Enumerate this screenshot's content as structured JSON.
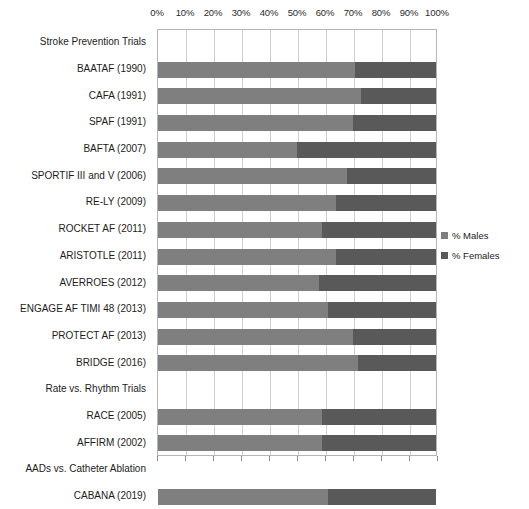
{
  "chart_data": {
    "type": "bar",
    "subtype": "stacked-horizontal-100pct",
    "title": "",
    "xlabel": "",
    "ylabel": "",
    "xlim": [
      0,
      100
    ],
    "grid": true,
    "orientation": "horizontal",
    "legend_position": "right",
    "xticks": [
      "0%",
      "10%",
      "20%",
      "30%",
      "40%",
      "50%",
      "60%",
      "70%",
      "80%",
      "90%",
      "100%"
    ],
    "xtick_values": [
      0,
      10,
      20,
      30,
      40,
      50,
      60,
      70,
      80,
      90,
      100
    ],
    "categories": [
      "Stroke Prevention Trials",
      "BAATAF (1990)",
      "CAFA (1991)",
      "SPAF (1991)",
      "BAFTA (2007)",
      "SPORTIF III and V (2006)",
      "RE-LY (2009)",
      "ROCKET AF (2011)",
      "ARISTOTLE (2011)",
      "AVERROES (2012)",
      "ENGAGE AF TIMI 48 (2013)",
      "PROTECT AF (2013)",
      "BRIDGE (2016)",
      "Rate vs. Rhythm Trials",
      "RACE (2005)",
      "AFFIRM (2002)",
      "AADs vs. Catheter Ablation",
      "CABANA (2019)"
    ],
    "category_is_header": [
      true,
      false,
      false,
      false,
      false,
      false,
      false,
      false,
      false,
      false,
      false,
      false,
      false,
      true,
      false,
      false,
      true,
      false
    ],
    "series": [
      {
        "name": "% Males",
        "color": "#7f7f7f",
        "values": [
          null,
          71,
          73,
          70,
          50,
          68,
          64,
          59,
          64,
          58,
          61,
          70,
          72,
          null,
          59,
          59,
          null,
          61
        ]
      },
      {
        "name": "% Females",
        "color": "#595959",
        "values": [
          null,
          29,
          27,
          30,
          50,
          32,
          36,
          41,
          36,
          42,
          39,
          30,
          28,
          null,
          41,
          41,
          null,
          39
        ]
      }
    ],
    "legend": [
      {
        "label": "% Males",
        "color": "#7f7f7f",
        "swatch": "males"
      },
      {
        "label": "% Females",
        "color": "#595959",
        "swatch": "females"
      }
    ]
  },
  "colors": {
    "males": "#7f7f7f",
    "females": "#595959",
    "gridline": "#cfcfcf",
    "axis": "#b5b5b5",
    "text": "#1c1c1c",
    "background": "#ffffff"
  }
}
